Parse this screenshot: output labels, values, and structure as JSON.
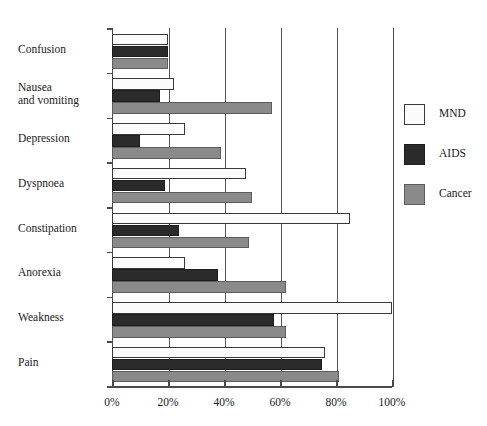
{
  "chart_data": {
    "type": "bar",
    "orientation": "horizontal",
    "title": "",
    "xlabel": "",
    "ylabel": "",
    "xlim": [
      0,
      100
    ],
    "xticks": [
      "0%",
      "20%",
      "40%",
      "60%",
      "80%",
      "100%"
    ],
    "xtick_values": [
      0,
      20,
      40,
      60,
      80,
      100
    ],
    "grid": true,
    "grid_axis": "x",
    "legend_position": "right",
    "categories": [
      "Confusion",
      "Nausea\nand vomiting",
      "Depression",
      "Dyspnoea",
      "Constipation",
      "Anorexia",
      "Weakness",
      "Pain"
    ],
    "series": [
      {
        "name": "MND",
        "color": "#fbfbfb",
        "values": [
          20,
          22,
          26,
          48,
          85,
          26,
          100,
          76
        ]
      },
      {
        "name": "AIDS",
        "color": "#2b2b2b",
        "values": [
          20,
          17,
          10,
          19,
          24,
          38,
          58,
          75
        ]
      },
      {
        "name": "Cancer",
        "color": "#8a8a8a",
        "values": [
          20,
          57,
          39,
          50,
          49,
          62,
          62,
          81
        ]
      }
    ]
  },
  "legend": {
    "items": [
      {
        "label": "MND",
        "swatch": "mnd"
      },
      {
        "label": "AIDS",
        "swatch": "aids"
      },
      {
        "label": "Cancer",
        "swatch": "cancer"
      }
    ]
  }
}
